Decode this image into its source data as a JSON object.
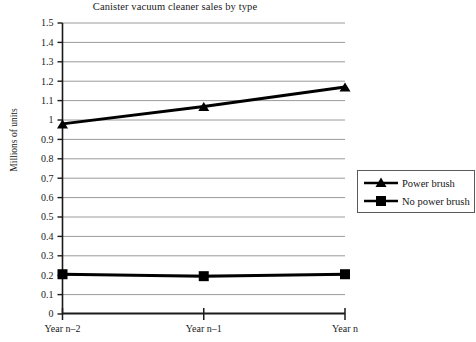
{
  "chart_data": {
    "type": "line",
    "title": "Canister vacuum cleaner sales by type",
    "xlabel": "",
    "ylabel": "Millions of units",
    "categories": [
      "Year n–2",
      "Year n–1",
      "Year n"
    ],
    "ylim": [
      0,
      1.5
    ],
    "ytick_values": [
      0,
      0.1,
      0.2,
      0.3,
      0.4,
      0.5,
      0.6,
      0.7,
      0.8,
      0.9,
      1,
      1.1,
      1.2,
      1.3,
      1.4,
      1.5
    ],
    "ytick_labels": [
      "0",
      "0.1",
      "0.2",
      "0.3",
      "0.4",
      "0.5",
      "0.6",
      "0.7",
      "0.8",
      "0.9",
      "1",
      "1.1",
      "1.2",
      "1.3",
      "1.4",
      "1.5"
    ],
    "grid": true,
    "legend_position": "right",
    "series": [
      {
        "name": "Power brush",
        "marker": "triangle",
        "color": "#000000",
        "values": [
          0.98,
          1.07,
          1.17
        ]
      },
      {
        "name": "No power brush",
        "marker": "square",
        "color": "#000000",
        "values": [
          0.205,
          0.195,
          0.205
        ]
      }
    ]
  },
  "legend": {
    "items": [
      {
        "label": "Power brush",
        "marker": "triangle-marker-icon"
      },
      {
        "label": "No power brush",
        "marker": "square-marker-icon"
      }
    ]
  }
}
